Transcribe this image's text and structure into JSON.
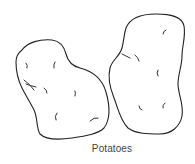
{
  "illustration": {
    "subject": "two potatoes line drawing",
    "caption": "Potatoes",
    "colors": {
      "background": "#ffffff",
      "line": "#222222",
      "caption": "#444444"
    }
  }
}
